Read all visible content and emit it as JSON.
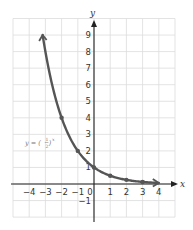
{
  "chart_data": {
    "type": "line",
    "title": "",
    "xlabel": "x",
    "ylabel": "y",
    "equation_label": "y = (1/2)^x",
    "equation_parts": {
      "lhs": "y = (",
      "num": "1",
      "den": "2",
      "rhs": ")",
      "exp": "x"
    },
    "xlim": [
      -5,
      5
    ],
    "ylim": [
      -2,
      10
    ],
    "grid": true,
    "x_ticks": [
      "−4",
      "−3",
      "−2",
      "−1",
      "0",
      "1",
      "2",
      "3",
      "4"
    ],
    "y_ticks": [
      "9",
      "8",
      "7",
      "6",
      "5",
      "4",
      "3",
      "2",
      "1",
      "−1"
    ],
    "x_tick_values": [
      -4,
      -3,
      -2,
      -1,
      0,
      1,
      2,
      3,
      4
    ],
    "y_tick_values": [
      9,
      8,
      7,
      6,
      5,
      4,
      3,
      2,
      1,
      -1
    ],
    "series": [
      {
        "name": "y = (1/2)^x",
        "points": [
          {
            "x": -2,
            "y": 4
          },
          {
            "x": -1,
            "y": 2
          },
          {
            "x": 0,
            "y": 1
          },
          {
            "x": 1,
            "y": 0.5
          },
          {
            "x": 2,
            "y": 0.25
          },
          {
            "x": 3,
            "y": 0.125
          }
        ],
        "curve_start": {
          "x": -3.17,
          "y": 9
        },
        "curve_end": {
          "x": 4,
          "y": 0.0625
        },
        "arrows_both_ends": true
      }
    ],
    "colors": {
      "curve": "#555555",
      "grid": "#dcdcdc",
      "axes": "#222222",
      "equation": "#777777"
    }
  }
}
